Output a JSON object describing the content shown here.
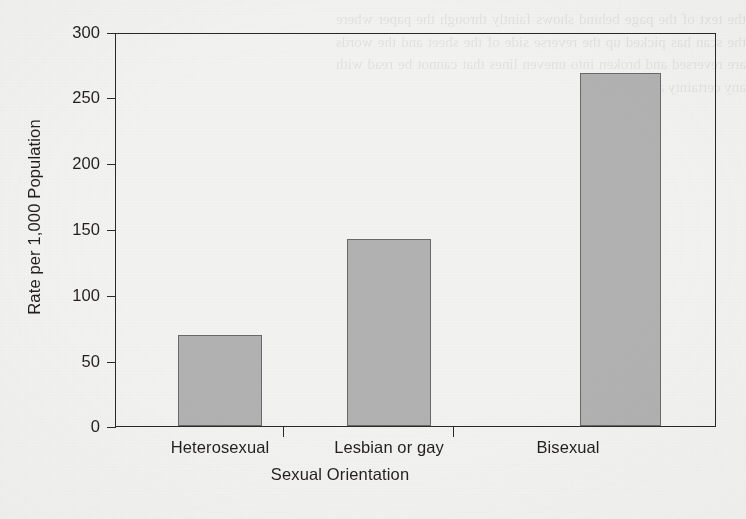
{
  "chart_data": {
    "type": "bar",
    "title": "",
    "subtitle": "",
    "categories": [
      "Heterosexual",
      "Lesbian or gay",
      "Bisexual"
    ],
    "values": [
      70,
      143,
      270
    ],
    "xlabel": "Sexual Orientation",
    "ylabel": "Rate per 1,000 Population",
    "ylim": [
      0,
      300
    ],
    "ytick_labels": [
      "0",
      "50",
      "100",
      "150",
      "200",
      "250",
      "300"
    ],
    "ytick_values": [
      0,
      50,
      100,
      150,
      200,
      250,
      300
    ],
    "ytick_step": 50,
    "xlim_categories": 3,
    "grid": false,
    "legend": false,
    "legend_position": "none",
    "series": [
      {
        "name": "Rate per 1,000 Population",
        "values": [
          70,
          143,
          270
        ]
      }
    ],
    "annotations": [],
    "colors": {
      "bar_fill": "#b3b3b3",
      "bar_edge": "#6a6a6a",
      "axis": "#2a2a2a",
      "text": "#231f20",
      "background": "#f4f4f3"
    }
  },
  "figure": {
    "y_axis_title": "Rate per 1,000 Population",
    "x_axis_title": "Sexual Orientation",
    "y_labels": {
      "t300": "300",
      "t250": "250",
      "t200": "200",
      "t150": "150",
      "t100": "100",
      "t50": "50",
      "t0": "0"
    },
    "x_labels": {
      "cat1": "Heterosexual",
      "cat2": "Lesbian or gay",
      "cat3": "Bisexual"
    }
  },
  "page": {
    "bleed_through_text": "the text of the page behind shows faintly through the paper where the scan has picked up the reverse side of the sheet and the words are reversed and broken into uneven lines that cannot be read with any certainty at all here"
  }
}
